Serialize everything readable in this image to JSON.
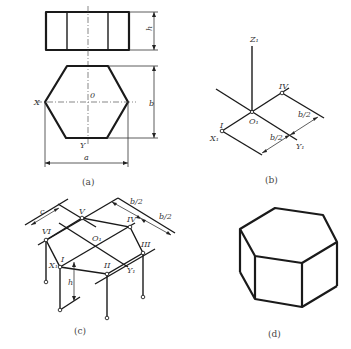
{
  "figures": {
    "a": {
      "caption": "(a)",
      "labels": {
        "height_top": "h",
        "height_hex": "b",
        "width": "a",
        "origin": "0",
        "x_axis": "X",
        "y_axis": "Y"
      }
    },
    "b": {
      "caption": "(b)",
      "labels": {
        "z_axis": "Z₁",
        "origin": "O₁",
        "x_axis": "X₁",
        "y_axis": "Y₁",
        "point_1": "I",
        "point_4": "IV",
        "dim_1": "b/2",
        "dim_2": "b/2"
      }
    },
    "c": {
      "caption": "(c)",
      "labels": {
        "origin": "O₁",
        "x_axis": "X₁",
        "y_axis": "Y₁",
        "p1": "I",
        "p2": "II",
        "p3": "III",
        "p4": "IV",
        "p5": "V",
        "p6": "VI",
        "dim_c": "c",
        "dim_b1": "b/2",
        "dim_b2": "b/2",
        "dim_h": "h"
      }
    },
    "d": {
      "caption": "(d)"
    }
  }
}
